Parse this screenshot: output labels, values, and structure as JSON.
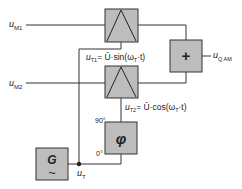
{
  "diagram": {
    "type": "block-diagram",
    "title": "",
    "colors": {
      "block_fill": "#bdbdbd",
      "line": "#333333",
      "background": "#ffffff"
    },
    "inputs": {
      "um1": {
        "symbol": "u",
        "sub": "M1"
      },
      "um2": {
        "symbol": "u",
        "sub": "M2"
      }
    },
    "output": {
      "symbol": "u",
      "sub": "Q AM"
    },
    "blocks": {
      "multiplier_top": {
        "glyph": "multiplier"
      },
      "multiplier_bottom": {
        "glyph": "multiplier"
      },
      "summer": {
        "glyph": "+"
      },
      "phase_shifter": {
        "glyph": "φ",
        "port_top": "90°",
        "port_bottom": "0°"
      },
      "generator": {
        "glyph": "G",
        "wave": "~"
      }
    },
    "signals": {
      "ut1": {
        "symbol": "u",
        "sub": "T1",
        "expr": "= Û·sin(ω",
        "expr_sub": "T",
        "expr_end": "·t)"
      },
      "ut2": {
        "symbol": "u",
        "sub": "T2",
        "expr": "= Û·cos(ω",
        "expr_sub": "T",
        "expr_end": "·t)"
      },
      "ut": {
        "symbol": "u",
        "sub": "T"
      }
    }
  }
}
